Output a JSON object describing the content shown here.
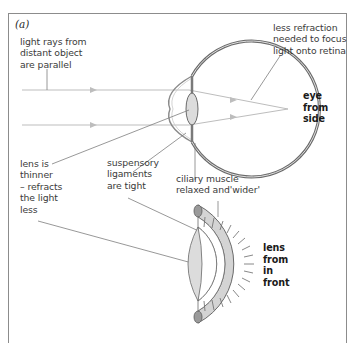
{
  "figure": {
    "panel_label": "(a)",
    "views": {
      "side": "eye\nfrom\nside",
      "front": "lens\nfrom\nin\nfront"
    },
    "annotations": {
      "light_rays": "light rays from\ndistant object\nare parallel",
      "less_refraction": "less refraction\nneeded to focus\nlight onto retina",
      "lens_thinner": "lens is\nthinner\n– refracts\nthe light\nless",
      "suspensory": "suspensory\nligaments\nare tight",
      "ciliary": "ciliary muscle\nrelaxed and'wider'"
    },
    "colors": {
      "frame": "#8c8c8c",
      "ray": "#b8b8b8",
      "eye_outline": "#5a5a5a",
      "lens_fill": "#dcdcdc",
      "muscle_fill": "#d4d4d4",
      "leader": "#7a7a7a"
    }
  }
}
